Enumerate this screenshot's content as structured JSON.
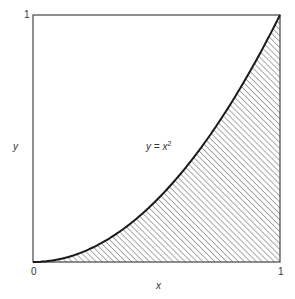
{
  "figure": {
    "curve_label_base": "y = x",
    "curve_label_exp": "2",
    "x_axis_label": "x",
    "y_axis_label": "y",
    "x_tick_min": "0",
    "x_tick_max": "1",
    "y_tick_max": "1",
    "line_color": "#1a1a1a",
    "hatch_color": "#555555",
    "frame_color": "#444444"
  },
  "chart_data": {
    "type": "area",
    "title": "",
    "function": "y = x^2",
    "annotation": "y = x²",
    "xlabel": "x",
    "ylabel": "y",
    "xlim": [
      0,
      1
    ],
    "ylim": [
      0,
      1
    ],
    "x_ticks": [
      "0",
      "1"
    ],
    "y_ticks": [
      "1"
    ],
    "grid": false,
    "legend": null,
    "shaded_region": "area under y = x^2 from x = 0 to x = 1 (diagonal hatching)",
    "x": [
      0,
      0.1,
      0.2,
      0.3,
      0.4,
      0.5,
      0.6,
      0.7,
      0.8,
      0.9,
      1.0
    ],
    "series": [
      {
        "name": "y = x^2",
        "values": [
          0,
          0.01,
          0.04,
          0.09,
          0.16,
          0.25,
          0.36,
          0.49,
          0.64,
          0.81,
          1.0
        ]
      }
    ]
  }
}
